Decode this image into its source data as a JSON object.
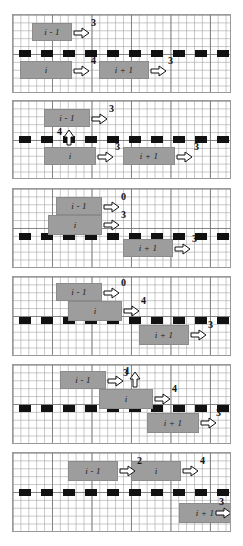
{
  "figure": {
    "bar_labels": {
      "prev": "i - 1",
      "curr": "i",
      "next": "i + 1"
    },
    "panels": [
      {
        "id": "panel-1",
        "bars": [
          {
            "name": "bar-i-minus-1",
            "label": "i - 1",
            "x": 19,
            "y": 8,
            "w": 40,
            "h": 18
          },
          {
            "name": "bar-i",
            "label": "i",
            "x": 7,
            "y": 46,
            "w": 52,
            "h": 18
          },
          {
            "name": "bar-i-plus-1",
            "label": "i + 1",
            "x": 86,
            "y": 46,
            "w": 50,
            "h": 18
          }
        ],
        "arrows": [
          {
            "name": "arrow-i-minus-1",
            "dir": "right",
            "x": 60,
            "y": 12,
            "value": "3",
            "nx": 78,
            "ny": 3
          },
          {
            "name": "arrow-i",
            "dir": "right",
            "x": 60,
            "y": 50,
            "value": "4",
            "nx": 78,
            "ny": 41
          },
          {
            "name": "arrow-i-plus-1",
            "dir": "right",
            "x": 137,
            "y": 50,
            "value": "3",
            "nx": 155,
            "ny": 41
          }
        ]
      },
      {
        "id": "panel-2",
        "bars": [
          {
            "name": "bar-i-minus-1",
            "label": "i - 1",
            "x": 31,
            "y": 8,
            "w": 46,
            "h": 18
          },
          {
            "name": "bar-i",
            "label": "i",
            "x": 31,
            "y": 46,
            "w": 52,
            "h": 18
          },
          {
            "name": "bar-i-plus-1",
            "label": "i + 1",
            "x": 110,
            "y": 46,
            "w": 52,
            "h": 18
          }
        ],
        "arrows": [
          {
            "name": "arrow-i-minus-1",
            "dir": "right",
            "x": 78,
            "y": 12,
            "value": "3",
            "nx": 96,
            "ny": 3
          },
          {
            "name": "arrow-i-up",
            "dir": "up",
            "x": 50,
            "y": 28,
            "value": "4",
            "nx": 44,
            "ny": 26
          },
          {
            "name": "arrow-i",
            "dir": "right",
            "x": 84,
            "y": 50,
            "value": "3",
            "nx": 102,
            "ny": 41
          },
          {
            "name": "arrow-i-plus-1",
            "dir": "right",
            "x": 163,
            "y": 50,
            "value": "3",
            "nx": 181,
            "ny": 41
          }
        ]
      },
      {
        "id": "panel-3",
        "bars": [
          {
            "name": "bar-i-minus-1",
            "label": "i - 1",
            "x": 43,
            "y": 8,
            "w": 46,
            "h": 18
          },
          {
            "name": "bar-i",
            "label": "i",
            "x": 35,
            "y": 26,
            "w": 54,
            "h": 20
          },
          {
            "name": "bar-i-plus-1",
            "label": "i + 1",
            "x": 110,
            "y": 50,
            "w": 50,
            "h": 18
          }
        ],
        "arrows": [
          {
            "name": "arrow-i-minus-1",
            "dir": "right",
            "x": 90,
            "y": 12,
            "value": "0",
            "nx": 108,
            "ny": 3
          },
          {
            "name": "arrow-i",
            "dir": "right",
            "x": 90,
            "y": 30,
            "value": "3",
            "nx": 108,
            "ny": 21
          },
          {
            "name": "arrow-i-plus-1",
            "dir": "right",
            "x": 161,
            "y": 54,
            "value": "3",
            "nx": 179,
            "ny": 45
          }
        ]
      },
      {
        "id": "panel-4",
        "bars": [
          {
            "name": "bar-i-minus-1",
            "label": "i - 1",
            "x": 43,
            "y": 6,
            "w": 46,
            "h": 18
          },
          {
            "name": "bar-i",
            "label": "i",
            "x": 55,
            "y": 24,
            "w": 54,
            "h": 20
          },
          {
            "name": "bar-i-plus-1",
            "label": "i + 1",
            "x": 126,
            "y": 48,
            "w": 50,
            "h": 20
          }
        ],
        "arrows": [
          {
            "name": "arrow-i-minus-1",
            "dir": "right",
            "x": 90,
            "y": 10,
            "value": "0",
            "nx": 108,
            "ny": 1
          },
          {
            "name": "arrow-i",
            "dir": "right",
            "x": 110,
            "y": 28,
            "value": "4",
            "nx": 128,
            "ny": 19
          },
          {
            "name": "arrow-i-plus-1",
            "dir": "right",
            "x": 177,
            "y": 52,
            "value": "3",
            "nx": 195,
            "ny": 43
          }
        ]
      },
      {
        "id": "panel-5",
        "bars": [
          {
            "name": "bar-i-minus-1",
            "label": "i - 1",
            "x": 47,
            "y": 6,
            "w": 46,
            "h": 18
          },
          {
            "name": "bar-i",
            "label": "i",
            "x": 86,
            "y": 24,
            "w": 54,
            "h": 20
          },
          {
            "name": "bar-i-plus-1",
            "label": "i + 1",
            "x": 134,
            "y": 48,
            "w": 52,
            "h": 20
          }
        ],
        "arrows": [
          {
            "name": "arrow-i-minus-1",
            "dir": "right",
            "x": 94,
            "y": 10,
            "value": "1",
            "nx": 112,
            "ny": 1
          },
          {
            "name": "arrow-i-up",
            "dir": "up",
            "x": 116,
            "y": 6,
            "value": "3",
            "nx": 110,
            "ny": 3
          },
          {
            "name": "arrow-i",
            "dir": "right",
            "x": 141,
            "y": 28,
            "value": "4",
            "nx": 159,
            "ny": 19
          },
          {
            "name": "arrow-i-plus-1",
            "dir": "right",
            "x": 187,
            "y": 52,
            "value": "3",
            "nx": 203,
            "ny": 43
          }
        ]
      },
      {
        "id": "panel-6",
        "bars": [
          {
            "name": "bar-i-minus-1",
            "label": "i - 1",
            "x": 55,
            "y": 8,
            "w": 50,
            "h": 20
          },
          {
            "name": "bar-i",
            "label": "i",
            "x": 118,
            "y": 8,
            "w": 50,
            "h": 20
          },
          {
            "name": "bar-i-plus-1",
            "label": "i + 1",
            "x": 166,
            "y": 50,
            "w": 52,
            "h": 20
          }
        ],
        "arrows": [
          {
            "name": "arrow-i-minus-1",
            "dir": "right",
            "x": 106,
            "y": 12,
            "value": "2",
            "nx": 124,
            "ny": 3
          },
          {
            "name": "arrow-i",
            "dir": "right",
            "x": 169,
            "y": 12,
            "value": "4",
            "nx": 187,
            "ny": 3
          },
          {
            "name": "arrow-i-plus-1",
            "dir": "right",
            "x": 202,
            "y": 54,
            "value": "3",
            "nx": 206,
            "ny": 44
          }
        ]
      }
    ],
    "panel_geometry": [
      {
        "top": 14,
        "height": 79,
        "track_y": 35
      },
      {
        "top": 100,
        "height": 79,
        "track_y": 35
      },
      {
        "top": 188,
        "height": 80,
        "track_y": 44
      },
      {
        "top": 276,
        "height": 80,
        "track_y": 40
      },
      {
        "top": 364,
        "height": 80,
        "track_y": 40
      },
      {
        "top": 452,
        "height": 80,
        "track_y": 36
      }
    ]
  }
}
